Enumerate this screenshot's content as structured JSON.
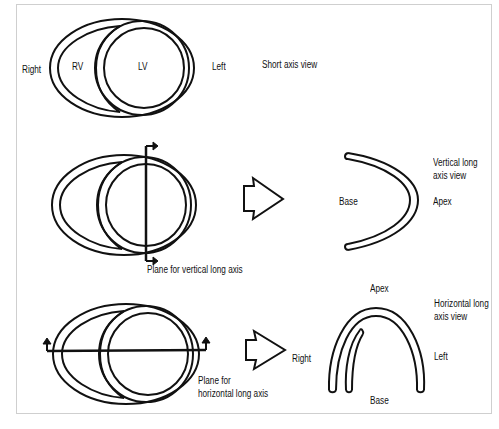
{
  "short_axis": {
    "label_right": "Right",
    "label_rv": "RV",
    "label_lv": "LV",
    "label_left": "Left",
    "view_label": "Short axis view"
  },
  "vertical_long_axis": {
    "plane_label": "Plane for vertical long axis",
    "label_base": "Base",
    "label_apex": "Apex",
    "view_label_line1": "Vertical long",
    "view_label_line2": "axis view"
  },
  "horizontal_long_axis": {
    "plane_label_line1": "Plane for",
    "plane_label_line2": "horizontal long axis",
    "label_right": "Right",
    "label_apex": "Apex",
    "label_base": "Base",
    "label_left": "Left",
    "view_label_line1": "Horizontal long",
    "view_label_line2": "axis view"
  },
  "colors": {
    "stroke": "#111111",
    "frame_border": "#cfcfcf",
    "background": "#ffffff"
  }
}
